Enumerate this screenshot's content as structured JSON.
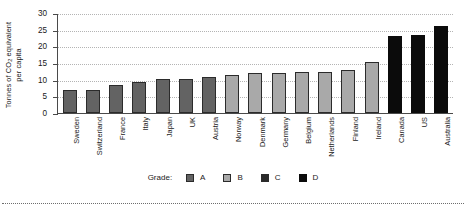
{
  "chart_data": {
    "type": "bar",
    "title": "",
    "xlabel": "",
    "ylabel_line1": "Tonnes of CO",
    "ylabel_sub": "2",
    "ylabel_line1b": " equivalent",
    "ylabel_line2": "per capita",
    "ylim": [
      0,
      30
    ],
    "ytick_step": 5,
    "yticks": [
      0,
      5,
      10,
      15,
      20,
      25,
      30
    ],
    "grid": true,
    "legend_position": "bottom",
    "categories": [
      "Sweden",
      "Switzerland",
      "France",
      "Italy",
      "Japan",
      "UK",
      "Austria",
      "Norway",
      "Denmark",
      "Germany",
      "Belgium",
      "Netherlands",
      "Finland",
      "Ireland",
      "Canada",
      "US",
      "Australia"
    ],
    "values": [
      6.9,
      7.1,
      8.4,
      9.3,
      10.2,
      10.3,
      10.8,
      11.5,
      12.0,
      12.1,
      12.4,
      12.5,
      13.0,
      15.5,
      23.4,
      23.6,
      26.4
    ],
    "grades": [
      "A",
      "A",
      "A",
      "A",
      "A",
      "A",
      "A",
      "B",
      "B",
      "B",
      "B",
      "B",
      "B",
      "B",
      "D",
      "D",
      "D"
    ]
  },
  "legend": {
    "title": "Grade:",
    "items": [
      {
        "label": "A",
        "color": "#636363"
      },
      {
        "label": "B",
        "color": "#a9a9a9"
      },
      {
        "label": "C",
        "color": "#2a2a2a"
      },
      {
        "label": "D",
        "color": "#0b0b0b"
      }
    ]
  }
}
